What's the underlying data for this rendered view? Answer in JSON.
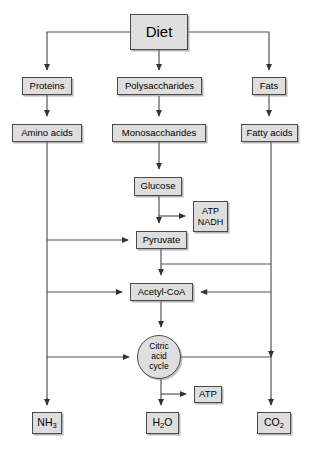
{
  "diagram": {
    "style": {
      "node_fill": "#dedede",
      "node_border": "#4a4a4a",
      "line_color": "#555555",
      "background": "#ffffff"
    },
    "nodes": {
      "diet": {
        "label": "Diet"
      },
      "proteins": {
        "label": "Proteins"
      },
      "polysaccharides": {
        "label": "Polysaccharides"
      },
      "fats": {
        "label": "Fats"
      },
      "amino_acids": {
        "label": "Amino acids"
      },
      "monosaccharides": {
        "label": "Monosaccharides"
      },
      "fatty_acids": {
        "label": "Fatty acids"
      },
      "glucose": {
        "label": "Glucose"
      },
      "atp_nadh_line1": {
        "label": "ATP"
      },
      "atp_nadh_line2": {
        "label": "NADH"
      },
      "pyruvate": {
        "label": "Pyruvate"
      },
      "acetyl_coa": {
        "label": "Acetyl-CoA"
      },
      "citric_acid_cycle_line1": {
        "label": "Citric"
      },
      "citric_acid_cycle_line2": {
        "label": "acid"
      },
      "citric_acid_cycle_line3": {
        "label": "cycle"
      },
      "atp": {
        "label": "ATP"
      },
      "ammonia_symbol": {
        "label": "NH"
      },
      "ammonia_sub": {
        "label": "3"
      },
      "water_symbol_1": {
        "label": "H"
      },
      "water_sub": {
        "label": "2"
      },
      "water_symbol_2": {
        "label": "O"
      },
      "carbon_dioxide_symbol": {
        "label": "CO"
      },
      "carbon_dioxide_sub": {
        "label": "2"
      }
    },
    "edges": [
      {
        "from": "diet",
        "to": "proteins"
      },
      {
        "from": "diet",
        "to": "polysaccharides"
      },
      {
        "from": "diet",
        "to": "fats"
      },
      {
        "from": "proteins",
        "to": "amino_acids"
      },
      {
        "from": "polysaccharides",
        "to": "monosaccharides"
      },
      {
        "from": "fats",
        "to": "fatty_acids"
      },
      {
        "from": "monosaccharides",
        "to": "glucose"
      },
      {
        "from": "glucose",
        "to": "pyruvate"
      },
      {
        "from": "glucose",
        "to": "atp_nadh"
      },
      {
        "from": "amino_acids",
        "to": "pyruvate"
      },
      {
        "from": "amino_acids",
        "to": "acetyl_coa"
      },
      {
        "from": "amino_acids",
        "to": "citric_acid_cycle"
      },
      {
        "from": "amino_acids",
        "to": "ammonia"
      },
      {
        "from": "pyruvate",
        "to": "acetyl_coa"
      },
      {
        "from": "pyruvate",
        "to": "carbon_dioxide"
      },
      {
        "from": "fatty_acids",
        "to": "acetyl_coa"
      },
      {
        "from": "acetyl_coa",
        "to": "citric_acid_cycle"
      },
      {
        "from": "citric_acid_cycle",
        "to": "atp"
      },
      {
        "from": "citric_acid_cycle",
        "to": "water"
      },
      {
        "from": "citric_acid_cycle",
        "to": "carbon_dioxide"
      }
    ]
  }
}
